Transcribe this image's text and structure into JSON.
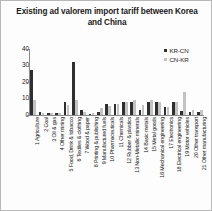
{
  "chart_data": {
    "type": "bar",
    "title": "Existing ad valorem import tariff between Korea and China",
    "xlabel": "",
    "ylabel": "",
    "ylim": [
      0,
      40
    ],
    "yticks": [
      0,
      10,
      20,
      30,
      40
    ],
    "grid": false,
    "legend_position": "top-right",
    "categories": [
      "1 Agriculture",
      "2 Coal",
      "3 Oil & gas",
      "4 Other mining",
      "5 Food, Drink & tobacco",
      "6 Textiles & clothing",
      "7 Wood & paper",
      "8 Printing & publishing",
      "9 Manufactured fuels",
      "10 Pharmaceuticals",
      "11 Chemicals",
      "12 Rubber & plastics",
      "13 Non-Metallic minerals",
      "14 Basic metals",
      "15 Metal goods",
      "16 Mechanical engineering",
      "17 Electronics",
      "18 Electrical engineering",
      "19 Motor vehicles",
      "20 Other transport",
      "21 Other manufacturing"
    ],
    "series": [
      {
        "name": "KR-CN",
        "color": "#2f2f2f",
        "values": [
          27.0,
          2.0,
          1.0,
          1.5,
          8.0,
          32.0,
          3.0,
          0.5,
          2.0,
          6.5,
          6.5,
          8.0,
          8.0,
          3.0,
          8.0,
          8.0,
          5.0,
          8.0,
          2.5,
          2.0,
          2.0
        ]
      },
      {
        "name": "CN-KR",
        "color": "#c3c3c3",
        "values": [
          9.0,
          1.0,
          1.0,
          1.0,
          6.0,
          9.0,
          2.0,
          1.0,
          4.0,
          5.5,
          6.5,
          8.0,
          9.0,
          6.0,
          9.0,
          8.0,
          5.0,
          8.0,
          14.0,
          3.0,
          3.0
        ]
      }
    ]
  }
}
